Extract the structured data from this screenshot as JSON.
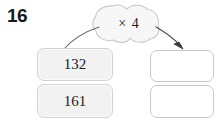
{
  "question": {
    "number": "16"
  },
  "rule": {
    "label": "× 4",
    "shape_name": "cloud-bubble"
  },
  "inputs": [
    {
      "value": "132"
    },
    {
      "value": "161"
    }
  ],
  "outputs": [
    {
      "value": ""
    },
    {
      "value": ""
    }
  ],
  "arrows": {
    "in_arrow_name": "input-curve",
    "out_arrow_name": "output-arrow"
  },
  "colors": {
    "text": "#1c1c1c",
    "box_fill": "#f2f2f2",
    "box_border": "#cfcfcf",
    "blank_fill": "#ffffff",
    "stroke": "#5a5a5a"
  }
}
